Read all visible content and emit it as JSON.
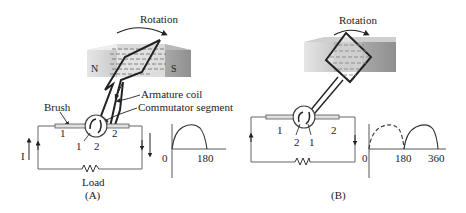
{
  "figure": {
    "panels": [
      {
        "id": "A",
        "caption": "(A)",
        "rotation_label": "Rotation",
        "magnet": {
          "north_label": "N",
          "south_label": "S"
        },
        "callouts": {
          "armature_coil": "Armature coil",
          "commutator_segment": "Commutator segment",
          "brush": "Brush"
        },
        "brush_numbers": [
          "1",
          "2"
        ],
        "segment_numbers": [
          "1",
          "2"
        ],
        "current_label": "I",
        "load_label": "Load",
        "waveform": {
          "origin_label": "0",
          "tick_labels": [
            "180"
          ]
        }
      },
      {
        "id": "B",
        "caption": "(B)",
        "rotation_label": "Rotation",
        "brush_numbers": [
          "1",
          "2"
        ],
        "segment_numbers": [
          "2",
          "1"
        ],
        "waveform": {
          "origin_label": "0",
          "tick_labels": [
            "180",
            "360"
          ]
        }
      }
    ]
  },
  "colors": {
    "line": "#222222",
    "magnet_dark": "#9a9a9a",
    "magnet_light": "#d8d8d8",
    "field_lines": "#ffffff"
  }
}
